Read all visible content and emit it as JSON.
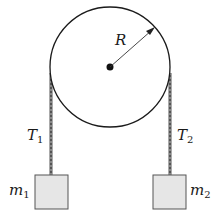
{
  "diagram": {
    "type": "pulley-system",
    "pulley": {
      "label": "R",
      "description": "pulley of radius R with central axle"
    },
    "ropes": [
      {
        "label_main": "T",
        "label_sub": "1",
        "side": "left"
      },
      {
        "label_main": "T",
        "label_sub": "2",
        "side": "right"
      }
    ],
    "masses": [
      {
        "label_main": "m",
        "label_sub": "1",
        "side": "left"
      },
      {
        "label_main": "m",
        "label_sub": "2",
        "side": "right"
      }
    ],
    "colors": {
      "line": "#1a1a1a",
      "box_fill": "#e6e6e6",
      "box_stroke": "#555555",
      "rope": "#666666"
    }
  }
}
